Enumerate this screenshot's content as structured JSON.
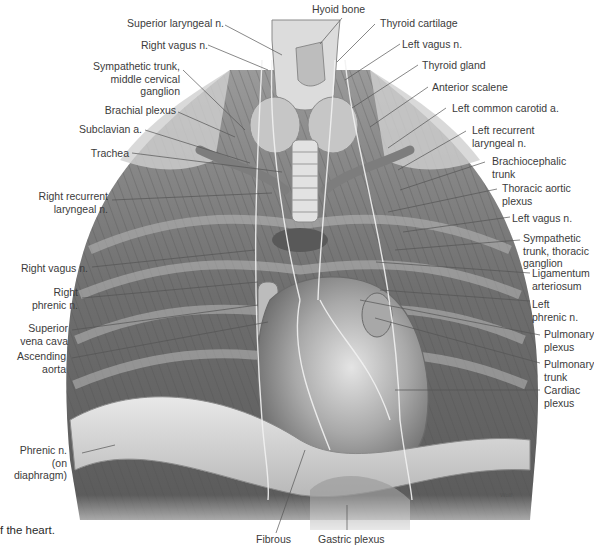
{
  "figure": {
    "caption_fragment": "f the heart.",
    "signature": "Wolf",
    "colors": {
      "background": "#ffffff",
      "label_text": "#3b3b3b",
      "leader_line": "#555555",
      "tissue_dark": "#4a4a4a",
      "tissue_mid": "#8a8a8a",
      "tissue_light": "#d8d8d8"
    }
  },
  "labels": {
    "left": [
      {
        "id": "superior-laryngeal-n",
        "text": "Superior laryngeal n."
      },
      {
        "id": "right-vagus-n-upper",
        "text": "Right vagus n."
      },
      {
        "id": "sympathetic-trunk-cervical",
        "text": "Sympathetic trunk,\nmiddle cervical\nganglion"
      },
      {
        "id": "brachial-plexus",
        "text": "Brachial plexus"
      },
      {
        "id": "subclavian-a",
        "text": "Subclavian a."
      },
      {
        "id": "trachea",
        "text": "Trachea"
      },
      {
        "id": "right-recurrent-laryngeal-n",
        "text": "Right recurrent\nlaryngeal n."
      },
      {
        "id": "right-vagus-n-lower",
        "text": "Right vagus n."
      },
      {
        "id": "right-phrenic-n",
        "text": "Right\nphrenic n."
      },
      {
        "id": "superior-vena-cava",
        "text": "Superior\nvena cava"
      },
      {
        "id": "ascending-aorta",
        "text": "Ascending\naorta"
      },
      {
        "id": "phrenic-n-diaphragm",
        "text": "Phrenic n.\n(on diaphragm)"
      }
    ],
    "top": [
      {
        "id": "hyoid-bone",
        "text": "Hyoid bone"
      }
    ],
    "right": [
      {
        "id": "thyroid-cartilage",
        "text": "Thyroid cartilage"
      },
      {
        "id": "left-vagus-n-upper",
        "text": "Left vagus n."
      },
      {
        "id": "thyroid-gland",
        "text": "Thyroid gland"
      },
      {
        "id": "anterior-scalene",
        "text": "Anterior scalene"
      },
      {
        "id": "left-common-carotid-a",
        "text": "Left common carotid a."
      },
      {
        "id": "left-recurrent-laryngeal-n",
        "text": "Left recurrent\nlaryngeal n."
      },
      {
        "id": "brachiocephalic-trunk",
        "text": "Brachiocephalic\ntrunk"
      },
      {
        "id": "thoracic-aortic-plexus",
        "text": "Thoracic aortic\nplexus"
      },
      {
        "id": "left-vagus-n-lower",
        "text": "Left vagus n."
      },
      {
        "id": "sympathetic-trunk-thoracic",
        "text": "Sympathetic\ntrunk, thoracic\nganglion"
      },
      {
        "id": "ligamentum-arteriosum",
        "text": "Ligamentum\narteriosum"
      },
      {
        "id": "left-phrenic-n",
        "text": "Left\nphrenic n."
      },
      {
        "id": "pulmonary-plexus",
        "text": "Pulmonary\nplexus"
      },
      {
        "id": "pulmonary-trunk",
        "text": "Pulmonary\ntrunk"
      },
      {
        "id": "cardiac-plexus",
        "text": "Cardiac\nplexus"
      }
    ],
    "bottom": [
      {
        "id": "fibrous",
        "text": "Fibrous"
      },
      {
        "id": "gastric-plexus",
        "text": "Gastric plexus"
      }
    ]
  }
}
